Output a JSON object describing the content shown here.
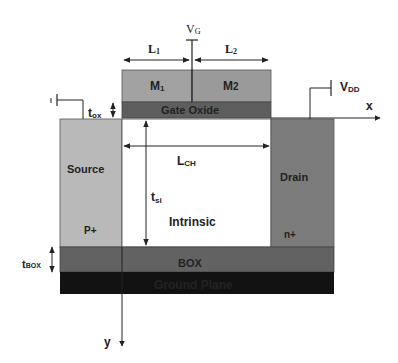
{
  "diagram": {
    "colors": {
      "metal1": "#a2a2a2",
      "metal2": "#9a9a9a",
      "gate_oxide": "#5e5e5e",
      "source": "#b9b9b9",
      "drain": "#7b7b7b",
      "channel": "#ffffff",
      "box": "#626262",
      "ground_plane": "#121212",
      "line": "#222222"
    },
    "labels": {
      "vg": "V",
      "vg_sub": "G",
      "l1": "L",
      "l1_sub": "1",
      "l2": "L",
      "l2_sub": "2",
      "m1": "M",
      "m1_sub": "1",
      "m2": "M",
      "m2_sub": "2",
      "gate_oxide": "Gate Oxide",
      "vdd": "V",
      "vdd_sub": "DD",
      "x_axis": "x",
      "y_axis": "y",
      "tox": "t",
      "tox_sub": "ox",
      "source": "Source",
      "source_doping": "P+",
      "drain": "Drain",
      "drain_doping": "n+",
      "lch": "L",
      "lch_sub": "CH",
      "tsi": "t",
      "tsi_sub": "si",
      "intrinsic": "Intrinsic",
      "tbox": "t",
      "tbox_sub": "BOX",
      "box": "BOX",
      "ground_plane": "Ground Plane"
    }
  }
}
